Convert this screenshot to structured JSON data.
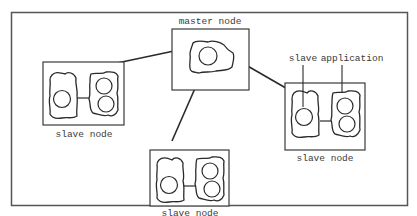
{
  "diagram": {
    "type": "distributed-system-architecture",
    "colors": {
      "stroke": "#3a3a3a",
      "background": "#ffffff",
      "frame": "#555555"
    },
    "nodes": [
      {
        "id": "master",
        "label": "master node",
        "processes": 1
      },
      {
        "id": "slave-left",
        "label": "slave node",
        "processes": 3
      },
      {
        "id": "slave-bottom",
        "label": "slave node",
        "processes": 3
      },
      {
        "id": "slave-right",
        "label": "slave node",
        "processes": 3
      }
    ],
    "edges": [
      {
        "from": "master",
        "to": "slave-left"
      },
      {
        "from": "master",
        "to": "slave-bottom"
      },
      {
        "from": "master",
        "to": "slave-right"
      }
    ],
    "annotations": [
      {
        "text": "slave application",
        "points_to": [
          "slave-right.process-1",
          "slave-right.process-2"
        ]
      }
    ],
    "labels": {
      "master": "master node",
      "slave_left": "slave node",
      "slave_bottom": "slave node",
      "slave_right": "slave node",
      "slave_application_1": "slave",
      "slave_application_2": "application"
    }
  }
}
